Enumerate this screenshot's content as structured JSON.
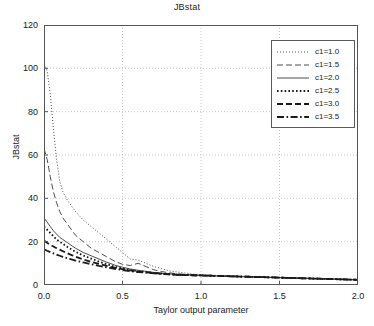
{
  "chart_data": {
    "type": "line",
    "title": "JBstat",
    "xlabel": "Taylor output parameter",
    "ylabel": "JBstat",
    "xlim": [
      0.0,
      2.0
    ],
    "ylim": [
      0,
      120
    ],
    "grid": true,
    "legend_position": "upper right",
    "xticks": [
      "0.0",
      "0.5",
      "1.0",
      "1.5",
      "2.0"
    ],
    "xtick_values": [
      0.0,
      0.5,
      1.0,
      1.5,
      2.0
    ],
    "yticks": [
      "0",
      "20",
      "40",
      "60",
      "80",
      "100",
      "120"
    ],
    "ytick_values": [
      0,
      20,
      40,
      60,
      80,
      100,
      120
    ],
    "x": [
      0.0,
      0.02,
      0.04,
      0.06,
      0.08,
      0.1,
      0.12,
      0.15,
      0.18,
      0.2,
      0.25,
      0.3,
      0.35,
      0.4,
      0.45,
      0.5,
      0.55,
      0.6,
      0.65,
      0.7,
      0.75,
      0.8,
      0.85,
      0.9,
      0.95,
      1.0,
      1.05,
      1.1,
      1.15,
      1.2,
      1.25,
      1.3,
      1.35,
      1.4,
      1.45,
      1.5,
      1.55,
      1.6,
      1.65,
      1.7,
      1.75,
      1.8,
      1.85,
      1.9,
      1.95,
      2.0
    ],
    "series": [
      {
        "name": "c1=1.0",
        "style": "dotted-fine",
        "color": "#4d4d4d",
        "width": 1.0,
        "values": [
          102,
          99,
          88,
          72,
          58,
          48,
          43,
          39,
          36,
          34,
          30,
          27,
          24,
          21,
          18,
          15,
          12,
          11.5,
          10,
          8.5,
          7.5,
          6.5,
          6,
          5.5,
          5,
          4.8,
          4.6,
          4.4,
          4.2,
          4.1,
          4.0,
          3.9,
          3.8,
          3.7,
          3.6,
          3.5,
          3.4,
          3.3,
          3.2,
          3.1,
          3.0,
          2.9,
          2.8,
          2.7,
          2.6,
          2.5
        ]
      },
      {
        "name": "c1=1.5",
        "style": "dashed",
        "color": "#4d4d4d",
        "width": 1.0,
        "values": [
          63,
          58,
          50,
          43,
          38,
          34,
          31,
          28,
          25,
          23,
          20,
          17,
          15,
          13,
          11,
          9.5,
          9,
          10,
          8.5,
          7,
          6.2,
          5.6,
          5.2,
          4.9,
          4.7,
          4.5,
          4.3,
          4.2,
          4.1,
          4.0,
          3.9,
          3.8,
          3.7,
          3.6,
          3.5,
          3.4,
          3.3,
          3.2,
          3.1,
          3.0,
          2.9,
          2.8,
          2.7,
          2.6,
          2.5,
          2.4
        ]
      },
      {
        "name": "c1=2.0",
        "style": "solid",
        "color": "#4d4d4d",
        "width": 1.0,
        "values": [
          31,
          29,
          27,
          25,
          23.5,
          22,
          21,
          19.5,
          18,
          17,
          15,
          13.5,
          12,
          10.5,
          9.2,
          8.2,
          7.4,
          6.8,
          6.3,
          5.8,
          5.4,
          5.1,
          4.9,
          4.7,
          4.5,
          4.4,
          4.3,
          4.2,
          4.1,
          4.0,
          3.9,
          3.8,
          3.7,
          3.6,
          3.5,
          3.4,
          3.3,
          3.2,
          3.1,
          3.0,
          2.9,
          2.8,
          2.7,
          2.6,
          2.5,
          2.4
        ]
      },
      {
        "name": "c1=2.5",
        "style": "dotted-thick",
        "color": "#1a1a1a",
        "width": 1.8,
        "values": [
          27,
          25.5,
          24,
          22.5,
          21,
          20,
          19,
          17.5,
          16.2,
          15.4,
          13.6,
          12.2,
          10.8,
          9.6,
          8.5,
          7.6,
          6.9,
          6.4,
          6.0,
          5.6,
          5.3,
          5.0,
          4.8,
          4.6,
          4.5,
          4.4,
          4.3,
          4.2,
          4.1,
          4.0,
          3.9,
          3.8,
          3.7,
          3.6,
          3.5,
          3.4,
          3.3,
          3.2,
          3.1,
          3.0,
          2.9,
          2.8,
          2.7,
          2.6,
          2.5,
          2.4
        ]
      },
      {
        "name": "c1=3.0",
        "style": "dashed-thick",
        "color": "#1a1a1a",
        "width": 1.8,
        "values": [
          20.5,
          19.5,
          18.6,
          17.8,
          17,
          16.3,
          15.6,
          14.6,
          13.7,
          13.1,
          11.8,
          10.7,
          9.7,
          8.8,
          8.0,
          7.3,
          6.7,
          6.2,
          5.8,
          5.5,
          5.2,
          4.9,
          4.7,
          4.6,
          4.5,
          4.4,
          4.3,
          4.2,
          4.1,
          4.0,
          3.9,
          3.8,
          3.7,
          3.6,
          3.5,
          3.4,
          3.3,
          3.2,
          3.1,
          3.0,
          2.9,
          2.8,
          2.7,
          2.6,
          2.5,
          2.4
        ]
      },
      {
        "name": "c1=3.5",
        "style": "dash-dot",
        "color": "#1a1a1a",
        "width": 1.8,
        "values": [
          16.5,
          15.8,
          15.2,
          14.6,
          14.0,
          13.5,
          13.0,
          12.3,
          11.7,
          11.3,
          10.4,
          9.6,
          8.8,
          8.1,
          7.5,
          6.9,
          6.4,
          6.0,
          5.7,
          5.4,
          5.1,
          4.9,
          4.7,
          4.6,
          4.5,
          4.4,
          4.3,
          4.2,
          4.1,
          4.0,
          3.9,
          3.8,
          3.7,
          3.6,
          3.5,
          3.4,
          3.3,
          3.2,
          3.1,
          3.0,
          2.9,
          2.8,
          2.7,
          2.6,
          2.5,
          2.4
        ]
      }
    ]
  }
}
